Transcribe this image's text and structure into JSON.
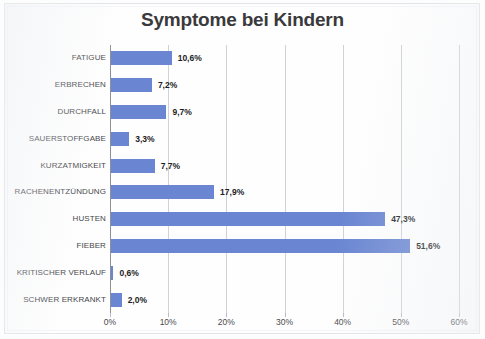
{
  "chart_data": {
    "type": "bar",
    "orientation": "horizontal",
    "title": "Symptome bei Kindern",
    "xlabel": "",
    "ylabel": "",
    "xlim": [
      0,
      60
    ],
    "xtick_labels": [
      "0%",
      "10%",
      "20%",
      "30%",
      "40%",
      "50%",
      "60%"
    ],
    "xtick_values": [
      0,
      10,
      20,
      30,
      40,
      50,
      60
    ],
    "grid": true,
    "legend": "none",
    "bar_color": "#6a86d2",
    "categories": [
      "FATIGUE",
      "ERBRECHEN",
      "DURCHFALL",
      "SAUERSTOFFGABE",
      "KURZATMIGKEIT",
      "RACHENENTZÜNDUNG",
      "HUSTEN",
      "FIEBER",
      "KRITISCHER VERLAUF",
      "SCHWER ERKRANKT"
    ],
    "values": [
      10.6,
      7.2,
      9.7,
      3.3,
      7.7,
      17.9,
      47.3,
      51.6,
      0.6,
      2.0
    ],
    "value_labels": [
      "10,6%",
      "7,2%",
      "9,7%",
      "3,3%",
      "7,7%",
      "17,9%",
      "47,3%",
      "51,6%",
      "0,6%",
      "2,0%"
    ]
  }
}
